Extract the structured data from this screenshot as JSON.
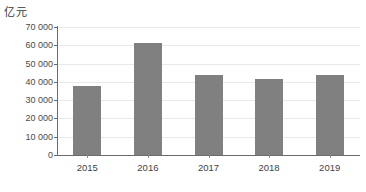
{
  "unit_label": "亿元",
  "chart_data": {
    "type": "bar",
    "title": "",
    "subtitle": "",
    "xlabel": "",
    "ylabel": "亿元",
    "categories": [
      "2015",
      "2016",
      "2017",
      "2018",
      "2019"
    ],
    "values": [
      38000,
      61000,
      43500,
      41500,
      43500
    ],
    "series": [
      {
        "name": "",
        "values": [
          38000,
          61000,
          43500,
          41500,
          43500
        ]
      }
    ],
    "ylim": [
      0,
      70000
    ],
    "ytick_values": [
      0,
      10000,
      20000,
      30000,
      40000,
      50000,
      60000,
      70000
    ],
    "ytick_labels": [
      "0",
      "10 000",
      "20 000",
      "30 000",
      "40 000",
      "50 000",
      "60 000",
      "70 000"
    ],
    "xtick_labels": [
      "2015",
      "2016",
      "2017",
      "2018",
      "2019"
    ],
    "grid": true,
    "grid_axis": "y",
    "legend": false,
    "legend_position": "none",
    "annotations": [],
    "colors": {
      "bar": "#808080",
      "gridline": "#e9e9e9",
      "axis": "#6b6b6b",
      "text": "#3f3f3f",
      "background": "#ffffff"
    }
  }
}
